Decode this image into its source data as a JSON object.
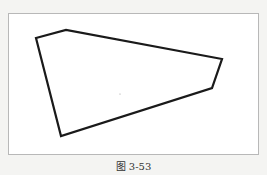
{
  "figure": {
    "caption": "图 3-53",
    "shape": "pentagon",
    "vertices": [
      {
        "x": 36,
        "y": 38
      },
      {
        "x": 66,
        "y": 30
      },
      {
        "x": 222,
        "y": 59
      },
      {
        "x": 212,
        "y": 88
      },
      {
        "x": 61,
        "y": 136
      }
    ],
    "stroke_color": "#1a1a1a",
    "stroke_width": 2.2
  }
}
